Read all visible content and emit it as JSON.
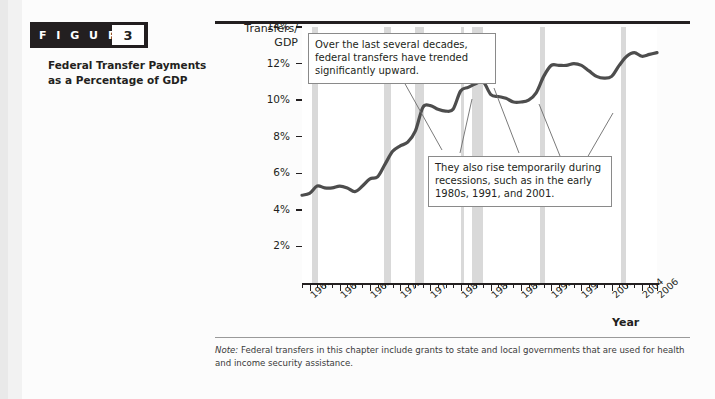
{
  "figure": {
    "badge_word": "F I G U R E",
    "number": "3",
    "title": "Federal Transfer Payments as a Percentage of GDP"
  },
  "note": {
    "prefix": "Note:",
    "text": "Federal transfers in this chapter include grants to state and local governments that are used for health and income security assistance."
  },
  "callouts": [
    {
      "id": "callout-trend",
      "text": "Over the last several decades, federal transfers have trended significantly upward."
    },
    {
      "id": "callout-recessions",
      "text": "They also rise temporarily during recessions, such as in the early 1980s, 1991, and 2001."
    }
  ],
  "chart_data": {
    "type": "line",
    "title": "Federal Transfer Payments as a Percentage of GDP",
    "xlabel": "Year",
    "ylabel": "Transfers/ GDP",
    "xlim": [
      1959,
      2006
    ],
    "ylim": [
      0,
      14
    ],
    "grid": false,
    "legend": "none",
    "ytick_labels": [
      "2%",
      "4%",
      "6%",
      "8%",
      "10%",
      "12%",
      "14%"
    ],
    "ytick_values": [
      2,
      4,
      6,
      8,
      10,
      12,
      14
    ],
    "xtick_labels": [
      "1960",
      "1964",
      "1968",
      "1972",
      "1976",
      "1980",
      "1984",
      "1988",
      "1992",
      "1996",
      "2000",
      "2004",
      "2006"
    ],
    "xtick_values": [
      1960,
      1964,
      1968,
      1972,
      1976,
      1980,
      1984,
      1988,
      1992,
      1996,
      2000,
      2004,
      2006
    ],
    "line_color": "#4d4d4d",
    "recession_band_color": "#d9d9d9",
    "recession_bands": [
      {
        "start": 1960.3,
        "end": 1961.1
      },
      {
        "start": 1969.9,
        "end": 1970.8
      },
      {
        "start": 1973.9,
        "end": 1975.2
      },
      {
        "start": 1980.1,
        "end": 1980.5
      },
      {
        "start": 1981.5,
        "end": 1982.9
      },
      {
        "start": 1990.5,
        "end": 1991.2
      },
      {
        "start": 2001.2,
        "end": 2001.9
      }
    ],
    "x": [
      1959,
      1960,
      1961,
      1962,
      1963,
      1964,
      1965,
      1966,
      1967,
      1968,
      1969,
      1970,
      1971,
      1972,
      1973,
      1974,
      1975,
      1976,
      1977,
      1978,
      1979,
      1980,
      1981,
      1982,
      1983,
      1984,
      1985,
      1986,
      1987,
      1988,
      1989,
      1990,
      1991,
      1992,
      1993,
      1994,
      1995,
      1996,
      1997,
      1998,
      1999,
      2000,
      2001,
      2002,
      2003,
      2004,
      2005,
      2006
    ],
    "y": [
      4.8,
      4.9,
      5.3,
      5.2,
      5.2,
      5.3,
      5.2,
      5.0,
      5.3,
      5.7,
      5.8,
      6.5,
      7.2,
      7.5,
      7.7,
      8.3,
      9.6,
      9.7,
      9.5,
      9.4,
      9.5,
      10.5,
      10.7,
      10.9,
      11.0,
      10.3,
      10.2,
      10.1,
      9.9,
      9.9,
      10.0,
      10.4,
      11.3,
      11.9,
      11.9,
      11.9,
      12.0,
      11.9,
      11.6,
      11.3,
      11.2,
      11.3,
      11.9,
      12.4,
      12.6,
      12.4,
      12.5,
      12.6
    ]
  }
}
